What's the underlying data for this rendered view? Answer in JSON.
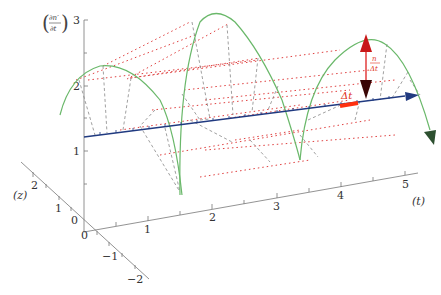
{
  "diagram": {
    "y_axis_label": "(∂n′/∂t)",
    "y_axis_label_num": "∂n′",
    "y_axis_label_den": "∂t",
    "y_ticks": [
      "1",
      "2",
      "3"
    ],
    "t_axis_label": "(t)",
    "t_ticks": [
      "1",
      "2",
      "3",
      "4",
      "5"
    ],
    "z_axis_label": "(z)",
    "z_ticks": [
      "2",
      "1",
      "0",
      "−1",
      "−2"
    ],
    "origin_label": "0",
    "delta_t_label": "Δt",
    "ratio_label_num": "n",
    "ratio_label_den": "Δt",
    "colors": {
      "arch_curve": "#6ab86a",
      "time_arrow": "#203a80",
      "dotted_red": "#e04040",
      "dashed_gray": "#888888",
      "ratio_arrow_top": "#d02020",
      "ratio_arrow_bottom": "#400808",
      "delta_t_bar": "#ff3010",
      "axis": "#666666"
    }
  }
}
